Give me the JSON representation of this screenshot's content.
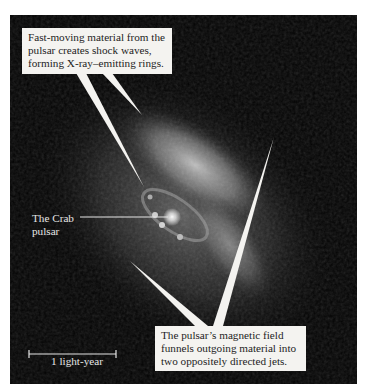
{
  "figure": {
    "colors": {
      "background": "#030303",
      "callout_fill": "#f4f3f0",
      "callout_text": "#1d1d1d",
      "label_text": "#e6e6e6"
    }
  },
  "annotations": {
    "top_callout": {
      "lines": [
        "Fast-moving material from the",
        "pulsar creates shock waves,",
        "forming X-ray–emitting rings."
      ]
    },
    "bottom_callout": {
      "lines": [
        "The pulsar’s magnetic field",
        "funnels outgoing material into",
        "two oppositely directed jets."
      ]
    },
    "pulsar_label": {
      "lines": [
        "The Crab",
        "pulsar"
      ]
    },
    "scale_bar": {
      "label": "1 light-year"
    }
  }
}
